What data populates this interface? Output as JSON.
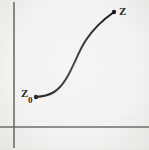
{
  "figure": {
    "kind": "hand-drawn-scanned-diagram",
    "background_color": "#f4f3f1",
    "ink_color": "#1d1c1b",
    "axis_color": "#6d6c6a"
  },
  "axes": {
    "vertical_axis": {
      "name": "vertical-axis",
      "x": 14,
      "y_top": 2,
      "y_bottom": 148
    },
    "horizontal_axis": {
      "name": "horizontal-axis",
      "y": 127,
      "x_left": 0,
      "x_right": 149
    },
    "origin": {
      "x": 14,
      "y": 127
    }
  },
  "curve": {
    "name": "sigmoid-curve",
    "shape": "S-shaped sigmoid",
    "start_point": {
      "x": 36,
      "y": 97
    },
    "end_point": {
      "x": 114,
      "y": 12
    },
    "path": "M 36 97 C 50 96, 58 92, 66 79 C 74 66, 78 52, 86 40 C 94 28, 104 19, 114 12",
    "stroke_width": 2.1
  },
  "labels": {
    "start_label": {
      "text": "Z",
      "subscript": "0",
      "full": "Z0"
    },
    "end_label": {
      "text": "Z"
    }
  }
}
